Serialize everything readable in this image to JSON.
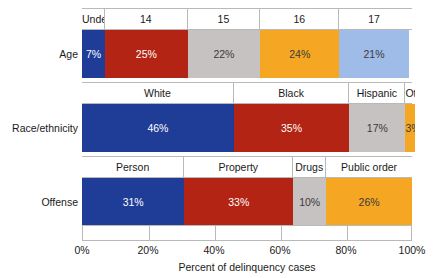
{
  "chart_data": {
    "type": "bar",
    "orientation": "horizontal",
    "stacked": true,
    "normalized": "100%",
    "title": "",
    "xlabel": "Percent of delinquency cases",
    "ylabel": "",
    "xlim": [
      0,
      100
    ],
    "xticks": [
      "0%",
      "20%",
      "40%",
      "60%",
      "80%",
      "100%"
    ],
    "xtick_values": [
      0,
      20,
      40,
      60,
      80,
      100
    ],
    "grid": false,
    "legend": "none",
    "segment_labels_position": "above-bar-band",
    "categories": [
      "Age",
      "Race/ethnicity",
      "Offense"
    ],
    "groups": [
      {
        "category": "Age",
        "segments": [
          {
            "label": "Under 13",
            "value": 7,
            "value_text": "7%",
            "color": "#1F3C96",
            "text_color": "light"
          },
          {
            "label": "14",
            "value": 25,
            "value_text": "25%",
            "color": "#B32414",
            "text_color": "light"
          },
          {
            "label": "15",
            "value": 22,
            "value_text": "22%",
            "color": "#C6C2C2",
            "text_color": "dark"
          },
          {
            "label": "16",
            "value": 24,
            "value_text": "24%",
            "color": "#F5A623",
            "text_color": "dark"
          },
          {
            "label": "17",
            "value": 21,
            "value_text": "21%",
            "color": "#9FBCE8",
            "text_color": "dark"
          }
        ]
      },
      {
        "category": "Race/ethnicity",
        "segments": [
          {
            "label": "White",
            "value": 46,
            "value_text": "46%",
            "color": "#1F3C96",
            "text_color": "light"
          },
          {
            "label": "Black",
            "value": 35,
            "value_text": "35%",
            "color": "#B32414",
            "text_color": "light"
          },
          {
            "label": "Hispanic",
            "value": 17,
            "value_text": "17%",
            "color": "#C6C2C2",
            "text_color": "dark"
          },
          {
            "label": "Othe",
            "value": 3,
            "value_text": "3%",
            "color": "#F5A623",
            "text_color": "dark"
          }
        ]
      },
      {
        "category": "Offense",
        "segments": [
          {
            "label": "Person",
            "value": 31,
            "value_text": "31%",
            "color": "#1F3C96",
            "text_color": "light"
          },
          {
            "label": "Property",
            "value": 33,
            "value_text": "33%",
            "color": "#B32414",
            "text_color": "light"
          },
          {
            "label": "Drugs",
            "value": 10,
            "value_text": "10%",
            "color": "#C6C2C2",
            "text_color": "dark"
          },
          {
            "label": "Public order",
            "value": 26,
            "value_text": "26%",
            "color": "#F5A623",
            "text_color": "dark"
          }
        ]
      }
    ],
    "colors": {
      "navy": "#1F3C96",
      "red": "#B32414",
      "gray": "#C6C2C2",
      "orange": "#F5A623",
      "light_blue": "#9FBCE8",
      "axis_line": "#B9B9B9",
      "background": "#FFFFFF",
      "text": "#1A1A1A"
    }
  }
}
